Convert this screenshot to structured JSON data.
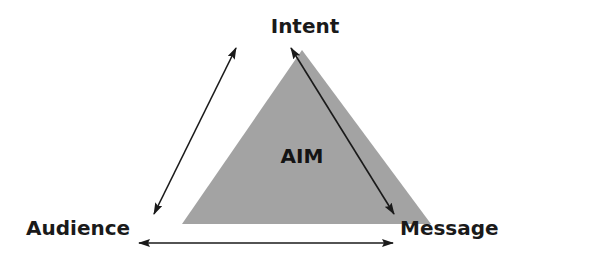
{
  "diagram": {
    "title": "AIM",
    "center_label": "AIM",
    "nodes": [
      {
        "id": "intent",
        "label": "Intent",
        "position": "top"
      },
      {
        "id": "audience",
        "label": "Audience",
        "position": "bottom-left"
      },
      {
        "id": "message",
        "label": "Message",
        "position": "bottom-right"
      }
    ],
    "edges": [
      {
        "from": "intent",
        "to": "audience",
        "type": "bidirectional-arrow"
      },
      {
        "from": "intent",
        "to": "message",
        "type": "bidirectional-arrow"
      },
      {
        "from": "audience",
        "to": "message",
        "type": "bidirectional-arrow"
      }
    ],
    "colors": {
      "triangle_fill": "#a3a3a3",
      "arrow": "#1a1a1a",
      "text": "#1a1a1a",
      "background": "#ffffff"
    }
  }
}
